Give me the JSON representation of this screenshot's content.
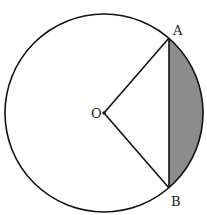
{
  "diagram": {
    "type": "geometry",
    "circle": {
      "cx": 104,
      "cy": 113,
      "r": 99
    },
    "points": {
      "O": {
        "label": "O",
        "x": 104,
        "y": 113
      },
      "A": {
        "label": "A",
        "x": 169,
        "y": 38
      },
      "B": {
        "label": "B",
        "x": 169,
        "y": 188
      }
    },
    "segments": [
      "OA",
      "OB",
      "AB"
    ],
    "shaded_region": "minor segment bounded by chord AB and arc AB",
    "colors": {
      "stroke": "#111111",
      "shade": "#8c8c8c",
      "background": "#ffffff"
    }
  }
}
